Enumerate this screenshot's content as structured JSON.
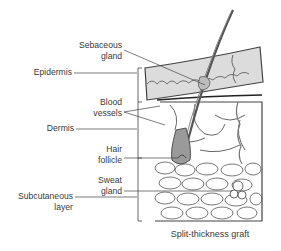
{
  "diagram": {
    "title": "Split-thickness graft",
    "labels": {
      "sebaceous_gland": [
        "Sebaceous",
        "gland"
      ],
      "epidermis": "Epidermis",
      "blood_vessels": [
        "Blood",
        "vessels"
      ],
      "dermis": "Dermis",
      "hair_follicle": [
        "Hair",
        "follicle"
      ],
      "sweat_gland": [
        "Sweat",
        "gland"
      ],
      "subcutaneous_layer": [
        "Subcutaneous",
        "layer"
      ]
    },
    "colors": {
      "epidermis_fill": "#d9d9d9",
      "line": "#555555",
      "follicle_fill": "#9a9a9a",
      "text": "#3a3a3a"
    }
  }
}
